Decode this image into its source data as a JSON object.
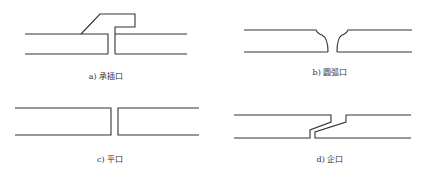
{
  "panels": [
    {
      "id": "a",
      "caption": "a) 承插口",
      "caption_x": 106,
      "caption_y": 70
    },
    {
      "id": "b",
      "caption": "b) 圆弧口",
      "caption_x": 330,
      "caption_y": 66
    },
    {
      "id": "c",
      "caption": "c) 平口",
      "caption_x": 110,
      "caption_y": 153
    },
    {
      "id": "d",
      "caption": "d) 企口",
      "caption_x": 330,
      "caption_y": 153
    }
  ],
  "colors": {
    "line": "#333333",
    "background": "#ffffff"
  }
}
